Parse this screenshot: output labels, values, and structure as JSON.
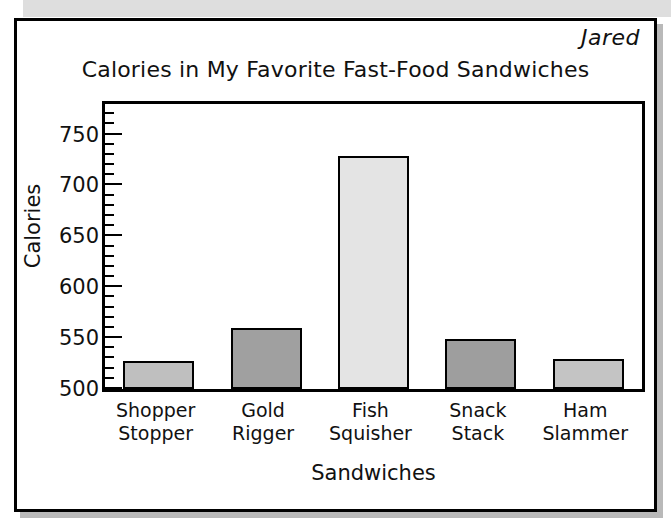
{
  "author_note": "Jared",
  "chart_data": {
    "type": "bar",
    "title": "Calories in My Favorite Fast-Food Sandwiches",
    "xlabel": "Sandwiches",
    "ylabel": "Calories",
    "categories": [
      "Shopper Stopper",
      "Gold Rigger",
      "Fish Squisher",
      "Snack Stack",
      "Ham Slammer"
    ],
    "category_lines": [
      [
        "Shopper",
        "Stopper"
      ],
      [
        "Gold",
        "Rigger"
      ],
      [
        "Fish",
        "Squisher"
      ],
      [
        "Snack",
        "Stack"
      ],
      [
        "Ham",
        "Slammer"
      ]
    ],
    "values": [
      528,
      560,
      729,
      549,
      529
    ],
    "bar_colors": [
      "#bfbfbf",
      "#a0a0a0",
      "#e4e4e4",
      "#9e9e9e",
      "#c4c4c4"
    ],
    "ylim": [
      500,
      780
    ],
    "ytick_labels": [
      "500",
      "550",
      "600",
      "650",
      "700",
      "750"
    ],
    "ytick_values": [
      500,
      550,
      600,
      650,
      700,
      750
    ],
    "ytick_minor_step": 10,
    "grid": false,
    "legend": "none"
  }
}
